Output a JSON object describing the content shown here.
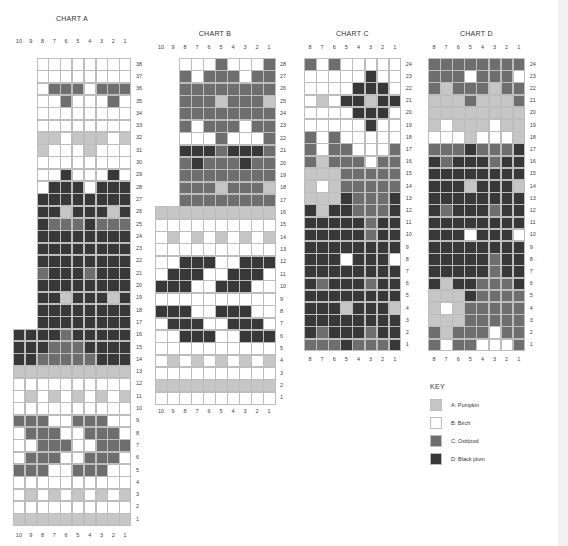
{
  "colors": {
    "A": "#c6c6c6",
    "B": "#ffffff",
    "C": "#6e6e6e",
    "D": "#383838"
  },
  "key": {
    "title": "KEY",
    "items": [
      {
        "code": "A",
        "label": "A: Pumpkin"
      },
      {
        "code": "B",
        "label": "B: Birch"
      },
      {
        "code": "C",
        "label": "C: Oxblood"
      },
      {
        "code": "D",
        "label": "D: Black plum"
      }
    ]
  },
  "charts": [
    {
      "id": "A",
      "title": "CHART A",
      "col_labels": [
        "10",
        "9",
        "8",
        "7",
        "6",
        "5",
        "4",
        "3",
        "2",
        "1"
      ],
      "left": 13,
      "top": 58,
      "cell_w": 11.8,
      "cell_h": 12.3,
      "total_cols": 10,
      "title_y": 15,
      "col_label_y": 38,
      "bottom_label_y": 532,
      "rows": [
        {
          "n": 38,
          "cells": "BBBBBBBB"
        },
        {
          "n": 37,
          "cells": "BBBBBBBB"
        },
        {
          "n": 36,
          "cells": "BCCCBCCC"
        },
        {
          "n": 35,
          "cells": "BBCBBBCB"
        },
        {
          "n": 34,
          "cells": "BBBBBBBB"
        },
        {
          "n": 33,
          "cells": "BBBBBBBB"
        },
        {
          "n": 32,
          "cells": "AABAAABA"
        },
        {
          "n": 31,
          "cells": "ABBBABBB"
        },
        {
          "n": 30,
          "cells": "BBBBBBBB"
        },
        {
          "n": 29,
          "cells": "BBDBBBDB"
        },
        {
          "n": 28,
          "cells": "BDDDBDDD"
        },
        {
          "n": 27,
          "cells": "DDDDDDDD"
        },
        {
          "n": 26,
          "cells": "DDADDDAD"
        },
        {
          "n": 25,
          "cells": "DCCCDCCC"
        },
        {
          "n": 24,
          "cells": "DDDDDDDD"
        },
        {
          "n": 23,
          "cells": "DDDDDDDD"
        },
        {
          "n": 22,
          "cells": "DDDDDDDD"
        },
        {
          "n": 21,
          "cells": "CDDDCDDD"
        },
        {
          "n": 20,
          "cells": "DDDDDDDD"
        },
        {
          "n": 19,
          "cells": "DDADDDAD"
        },
        {
          "n": 18,
          "cells": "DDDDDDDD"
        },
        {
          "n": 17,
          "cells": "DDDDDDDD"
        },
        {
          "n": 16,
          "cells": "DDDDCDDDDD"
        },
        {
          "n": 15,
          "cells": "DDDCCCDDDD"
        },
        {
          "n": 14,
          "cells": "DDCCCCCDDD"
        },
        {
          "n": 13,
          "cells": "AAAAAAAAAA"
        },
        {
          "n": 12,
          "cells": "BBBBBBBBBB"
        },
        {
          "n": 11,
          "cells": "BABABABABA"
        },
        {
          "n": 10,
          "cells": "BBBBBBBBBB"
        },
        {
          "n": 9,
          "cells": "CCCBBCCCBB"
        },
        {
          "n": 8,
          "cells": "BCCCBBCCCB"
        },
        {
          "n": 7,
          "cells": "BBCCCBBCCC"
        },
        {
          "n": 6,
          "cells": "BCCCBBCCCB"
        },
        {
          "n": 5,
          "cells": "CCCBBCCCBB"
        },
        {
          "n": 4,
          "cells": "BBBBBBBBBB"
        },
        {
          "n": 3,
          "cells": "BABABABABA"
        },
        {
          "n": 2,
          "cells": "BBBBBBBBBB"
        },
        {
          "n": 1,
          "cells": "AAAAAAAAAA"
        }
      ]
    },
    {
      "id": "B",
      "title": "CHART B",
      "col_labels": [
        "10",
        "9",
        "8",
        "7",
        "6",
        "5",
        "4",
        "3",
        "2",
        "1"
      ],
      "left": 155,
      "top": 58,
      "cell_w": 12.0,
      "cell_h": 12.36,
      "total_cols": 10,
      "title_y": 30,
      "col_label_y": 44,
      "bottom_label_y": 408,
      "rows": [
        {
          "n": 28,
          "cells": "BBBCBBBC"
        },
        {
          "n": 27,
          "cells": "CBCCCBCC"
        },
        {
          "n": 26,
          "cells": "CCCCCCCC"
        },
        {
          "n": 25,
          "cells": "CCCACCCA"
        },
        {
          "n": 24,
          "cells": "CCCCCCCC"
        },
        {
          "n": 23,
          "cells": "CBCCCBCC"
        },
        {
          "n": 22,
          "cells": "BBBCBBBC"
        },
        {
          "n": 21,
          "cells": "DDDCDDDC"
        },
        {
          "n": 20,
          "cells": "CDCCCDCC"
        },
        {
          "n": 19,
          "cells": "CCCCCCCC"
        },
        {
          "n": 18,
          "cells": "CCCACCCA"
        },
        {
          "n": 17,
          "cells": "CCCCCCCC"
        },
        {
          "n": 16,
          "cells": "AAAAAAAAAA"
        },
        {
          "n": 15,
          "cells": "BBBBBBBBBB"
        },
        {
          "n": 14,
          "cells": "BABABABABA"
        },
        {
          "n": 13,
          "cells": "BBBBBBBBBB"
        },
        {
          "n": 12,
          "cells": "BBDDDBBDDD"
        },
        {
          "n": 11,
          "cells": "BDDDBBDDDB"
        },
        {
          "n": 10,
          "cells": "DDDBBDDDBB"
        },
        {
          "n": 9,
          "cells": "BBBBBBBBBB"
        },
        {
          "n": 8,
          "cells": "DDDBBDDDBB"
        },
        {
          "n": 7,
          "cells": "BDDDBBDDDB"
        },
        {
          "n": 6,
          "cells": "BBDDDBBDDD"
        },
        {
          "n": 5,
          "cells": "BBBBBBBBBB"
        },
        {
          "n": 4,
          "cells": "BABABABABA"
        },
        {
          "n": 3,
          "cells": "BBBBBBBBBB"
        },
        {
          "n": 2,
          "cells": "AAAAAAAAAA"
        },
        {
          "n": 1,
          "cells": "BBBBBBBBBB"
        }
      ]
    },
    {
      "id": "C",
      "title": "CHART C",
      "col_labels": [
        "8",
        "7",
        "6",
        "5",
        "4",
        "3",
        "2",
        "1"
      ],
      "left": 304,
      "top": 58,
      "cell_w": 12.1,
      "cell_h": 12.2,
      "total_cols": 8,
      "title_y": 30,
      "col_label_y": 44,
      "bottom_label_y": 356,
      "rows": [
        {
          "n": 24,
          "cells": "CBCBBBBB"
        },
        {
          "n": 23,
          "cells": "BBBBBDBB"
        },
        {
          "n": 22,
          "cells": "BBBBDDDB"
        },
        {
          "n": 21,
          "cells": "BABDDADD"
        },
        {
          "n": 20,
          "cells": "BBBBDDDB"
        },
        {
          "n": 19,
          "cells": "BBBBBDBB"
        },
        {
          "n": 18,
          "cells": "CBCBBBBB"
        },
        {
          "n": 17,
          "cells": "CBCCBBBC"
        },
        {
          "n": 16,
          "cells": "CACCCBCC"
        },
        {
          "n": 15,
          "cells": "AAACCCCC"
        },
        {
          "n": 14,
          "cells": "ABACCCCC"
        },
        {
          "n": 13,
          "cells": "AAADCCCD"
        },
        {
          "n": 12,
          "cells": "DADDCCCD"
        },
        {
          "n": 11,
          "cells": "DDDDDCDD"
        },
        {
          "n": 10,
          "cells": "DDDDDCDD"
        },
        {
          "n": 9,
          "cells": "DDDDDDDD"
        },
        {
          "n": 8,
          "cells": "DDDBDDDB"
        },
        {
          "n": 7,
          "cells": "DDDDDDDD"
        },
        {
          "n": 6,
          "cells": "DCDDDCDD"
        },
        {
          "n": 5,
          "cells": "DDDDDDDD"
        },
        {
          "n": 4,
          "cells": "DDDADDDA"
        },
        {
          "n": 3,
          "cells": "DDDDDDDD"
        },
        {
          "n": 2,
          "cells": "DCDDDCDD"
        },
        {
          "n": 1,
          "cells": "CCCDCCCD"
        }
      ]
    },
    {
      "id": "D",
      "title": "CHART D",
      "col_labels": [
        "8",
        "7",
        "6",
        "5",
        "4",
        "3",
        "2",
        "1"
      ],
      "left": 428,
      "top": 58,
      "cell_w": 12.1,
      "cell_h": 12.2,
      "total_cols": 8,
      "title_y": 30,
      "col_label_y": 44,
      "bottom_label_y": 356,
      "rows": [
        {
          "n": 24,
          "cells": "CCCCCCCC"
        },
        {
          "n": 23,
          "cells": "CCCBCCCB"
        },
        {
          "n": 22,
          "cells": "CACCCACC"
        },
        {
          "n": 21,
          "cells": "AAACAAAC"
        },
        {
          "n": 20,
          "cells": "AAAAAAAA"
        },
        {
          "n": 19,
          "cells": "ABAAABAA"
        },
        {
          "n": 18,
          "cells": "BBBABBBA"
        },
        {
          "n": 17,
          "cells": "CCCDCCCD"
        },
        {
          "n": 16,
          "cells": "DCDDDCDD"
        },
        {
          "n": 15,
          "cells": "DDDDDDDD"
        },
        {
          "n": 14,
          "cells": "DDDADDDA"
        },
        {
          "n": 13,
          "cells": "DDDDDDDD"
        },
        {
          "n": 12,
          "cells": "DCDDDCDD"
        },
        {
          "n": 11,
          "cells": "DDDDDDDD"
        },
        {
          "n": 10,
          "cells": "DDDBDDDB"
        },
        {
          "n": 9,
          "cells": "DDDDDDDD"
        },
        {
          "n": 8,
          "cells": "DDDDDCDD"
        },
        {
          "n": 7,
          "cells": "DDDDDCDD"
        },
        {
          "n": 6,
          "cells": "DADDCCCD"
        },
        {
          "n": 5,
          "cells": "AAADCCCC"
        },
        {
          "n": 4,
          "cells": "ABACCCCC"
        },
        {
          "n": 3,
          "cells": "AAACCCCC"
        },
        {
          "n": 2,
          "cells": "CACCCBCC"
        },
        {
          "n": 1,
          "cells": "CBCCBBBC"
        }
      ]
    }
  ]
}
